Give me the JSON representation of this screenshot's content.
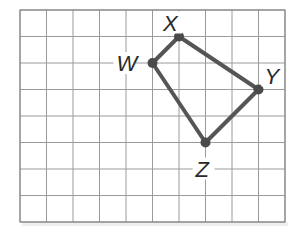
{
  "diagram": {
    "type": "coordinate-grid-quadrilateral",
    "grid": {
      "columns": 10,
      "rows": 8,
      "origin_x": 20,
      "origin_y": 10,
      "cell": 26.5,
      "line_color": "#9a9a9a",
      "border_color": "#8a8a8a"
    },
    "shape": {
      "stroke_color": "#555555",
      "stroke_width": 4,
      "vertex_color": "#4a4a4a",
      "order": [
        "W",
        "X",
        "Y",
        "Z"
      ]
    },
    "vertices": [
      {
        "name": "X",
        "label": "X",
        "col": 6,
        "row": 1,
        "label_dx": -16,
        "label_dy": -6
      },
      {
        "name": "W",
        "label": "W",
        "col": 5,
        "row": 2,
        "label_dx": -36,
        "label_dy": 8
      },
      {
        "name": "Y",
        "label": "Y",
        "col": 9,
        "row": 3,
        "label_dx": 6,
        "label_dy": -6
      },
      {
        "name": "Z",
        "label": "Z",
        "col": 7,
        "row": 5,
        "label_dx": -10,
        "label_dy": 34
      }
    ]
  }
}
